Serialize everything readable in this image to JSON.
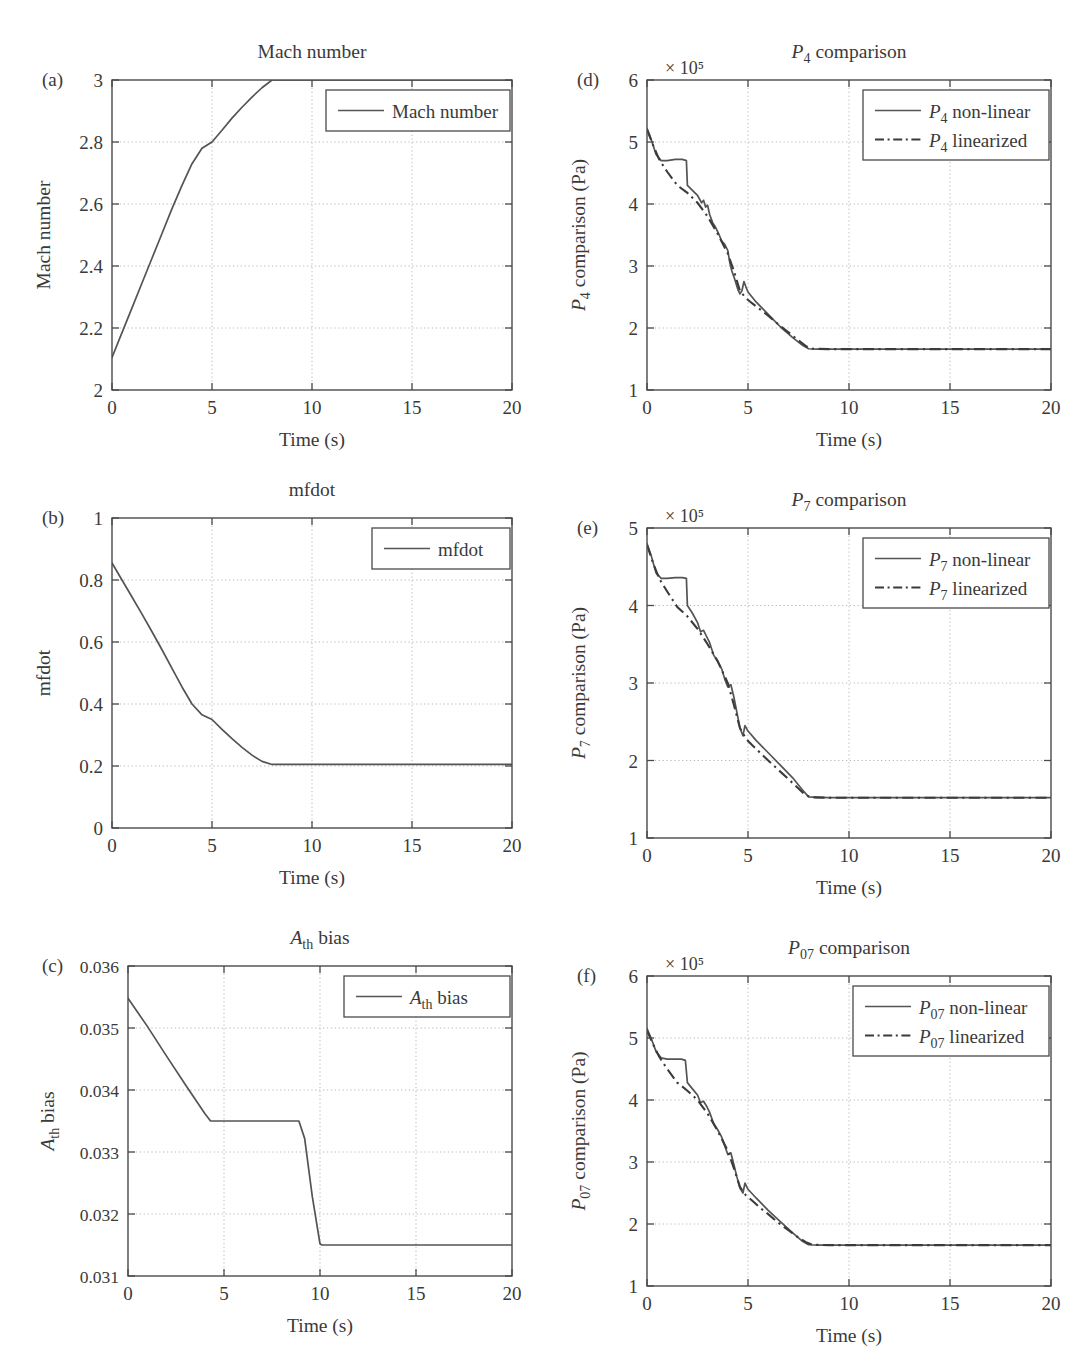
{
  "figure": {
    "panel_letters": [
      "(a)",
      "(b)",
      "(c)",
      "(d)",
      "(e)",
      "(f)"
    ],
    "xlabel": "Time (s)",
    "exponent_label": "× 10⁵"
  },
  "chart_data": [
    {
      "id": "a",
      "letter": "(a)",
      "type": "line",
      "title": "Mach number",
      "xlabel": "Time (s)",
      "ylabel": "Mach number",
      "xlim": [
        0,
        20
      ],
      "ylim": [
        2,
        3
      ],
      "xticks": [
        0,
        5,
        10,
        15,
        20
      ],
      "xticklabels": [
        "0",
        "5",
        "10",
        "15",
        "20"
      ],
      "yticks": [
        2,
        2.2,
        2.4,
        2.6,
        2.8,
        3
      ],
      "yticklabels": [
        "2",
        "2.2",
        "2.4",
        "2.6",
        "2.8",
        "3"
      ],
      "grid": true,
      "legend_position": "upper right",
      "series": [
        {
          "name": "Mach number",
          "style": "solid",
          "x": [
            0,
            0.5,
            1,
            1.5,
            2,
            2.5,
            3,
            3.5,
            4,
            4.5,
            5,
            5.5,
            6,
            6.5,
            7,
            7.5,
            8,
            8.5,
            20
          ],
          "y": [
            2.105,
            2.185,
            2.265,
            2.345,
            2.425,
            2.505,
            2.585,
            2.66,
            2.73,
            2.78,
            2.8,
            2.838,
            2.877,
            2.912,
            2.945,
            2.975,
            3.0,
            3.0,
            3.0
          ]
        }
      ]
    },
    {
      "id": "b",
      "letter": "(b)",
      "type": "line",
      "title": "mfdot",
      "xlabel": "Time (s)",
      "ylabel": "mfdot",
      "xlim": [
        0,
        20
      ],
      "ylim": [
        0,
        1
      ],
      "xticks": [
        0,
        5,
        10,
        15,
        20
      ],
      "xticklabels": [
        "0",
        "5",
        "10",
        "15",
        "20"
      ],
      "yticks": [
        0,
        0.2,
        0.4,
        0.6,
        0.8,
        1
      ],
      "yticklabels": [
        "0",
        "0.2",
        "0.4",
        "0.6",
        "0.8",
        "1"
      ],
      "grid": true,
      "legend_position": "upper right",
      "series": [
        {
          "name": "mfdot",
          "style": "solid",
          "x": [
            0,
            0.5,
            1,
            1.5,
            2,
            2.5,
            3,
            3.5,
            4,
            4.5,
            5,
            5.5,
            6,
            6.5,
            7,
            7.5,
            8,
            9,
            20
          ],
          "y": [
            0.855,
            0.8,
            0.745,
            0.69,
            0.633,
            0.575,
            0.515,
            0.455,
            0.4,
            0.365,
            0.35,
            0.318,
            0.288,
            0.26,
            0.235,
            0.215,
            0.205,
            0.205,
            0.205
          ]
        }
      ]
    },
    {
      "id": "c",
      "letter": "(c)",
      "type": "line",
      "title": "A_th bias",
      "title_parts": {
        "sym": "A",
        "sub": "th",
        "rest": " bias"
      },
      "xlabel": "Time (s)",
      "ylabel": "A_th bias",
      "xlim": [
        0,
        20
      ],
      "ylim": [
        0.031,
        0.036
      ],
      "xticks": [
        0,
        5,
        10,
        15,
        20
      ],
      "xticklabels": [
        "0",
        "5",
        "10",
        "15",
        "20"
      ],
      "yticks": [
        0.031,
        0.032,
        0.033,
        0.034,
        0.035,
        0.036
      ],
      "yticklabels": [
        "0.031",
        "0.032",
        "0.033",
        "0.034",
        "0.035",
        "0.036"
      ],
      "grid": true,
      "legend_position": "upper right",
      "series": [
        {
          "name": "A_th bias",
          "style": "solid",
          "x": [
            0,
            1,
            2,
            3,
            4,
            4.3,
            6,
            8,
            8.9,
            9.2,
            9.6,
            10,
            10.1,
            15,
            20
          ],
          "y": [
            0.03548,
            0.03503,
            0.03455,
            0.03408,
            0.03362,
            0.0335,
            0.0335,
            0.0335,
            0.0335,
            0.03322,
            0.03228,
            0.03152,
            0.0315,
            0.0315,
            0.0315
          ]
        }
      ]
    },
    {
      "id": "d",
      "letter": "(d)",
      "type": "line",
      "title": "P_4 comparison",
      "title_parts": {
        "sym": "P",
        "sub": "4",
        "rest": " comparison"
      },
      "xlabel": "Time (s)",
      "ylabel": "P_4 comparison (Pa)",
      "exponent_label": "× 10⁵",
      "xlim": [
        0,
        20
      ],
      "ylim": [
        1,
        6
      ],
      "xticks": [
        0,
        5,
        10,
        15,
        20
      ],
      "xticklabels": [
        "0",
        "5",
        "10",
        "15",
        "20"
      ],
      "yticks": [
        1,
        2,
        3,
        4,
        5,
        6
      ],
      "yticklabels": [
        "1",
        "2",
        "3",
        "4",
        "5",
        "6"
      ],
      "grid": true,
      "legend_position": "upper right",
      "legend_entries": [
        {
          "label_sym": "P",
          "label_sub": "4",
          "label_rest": " non-linear",
          "style": "solid"
        },
        {
          "label_sym": "P",
          "label_sub": "4",
          "label_rest": " linearized",
          "style": "dashdot"
        }
      ],
      "series": [
        {
          "name": "P_4 non-linear",
          "style": "solid",
          "x": [
            0,
            0.2,
            0.45,
            0.7,
            1.0,
            1.4,
            1.75,
            1.95,
            2.0,
            2.25,
            2.5,
            2.7,
            2.8,
            2.9,
            3.0,
            3.1,
            3.25,
            3.4,
            3.55,
            3.7,
            3.85,
            4.0,
            4.1,
            4.2,
            4.35,
            4.5,
            4.6,
            4.7,
            4.8,
            4.9,
            5.0,
            5.4,
            6.0,
            6.6,
            7.2,
            7.7,
            8.0,
            8.4,
            9.0,
            10,
            12,
            14,
            16,
            18,
            20
          ],
          "y": [
            5.22,
            5.05,
            4.8,
            4.7,
            4.7,
            4.72,
            4.72,
            4.7,
            4.3,
            4.22,
            4.14,
            4.02,
            4.06,
            3.95,
            3.98,
            3.83,
            3.7,
            3.62,
            3.52,
            3.4,
            3.35,
            3.25,
            3.05,
            2.92,
            2.78,
            2.62,
            2.55,
            2.6,
            2.75,
            2.66,
            2.58,
            2.42,
            2.22,
            2.02,
            1.85,
            1.72,
            1.665,
            1.66,
            1.66,
            1.66,
            1.66,
            1.66,
            1.66,
            1.66,
            1.66
          ]
        },
        {
          "name": "P_4 linearized",
          "style": "dashdot",
          "x": [
            0,
            0.3,
            0.6,
            1.0,
            1.5,
            2.0,
            2.5,
            3.0,
            3.5,
            4.0,
            4.3,
            4.6,
            4.9,
            5.2,
            5.6,
            6.0,
            6.5,
            7.0,
            7.5,
            7.9,
            8.2,
            9.0,
            10,
            12,
            14,
            16,
            18,
            20
          ],
          "y": [
            5.2,
            4.95,
            4.72,
            4.52,
            4.3,
            4.18,
            4.02,
            3.8,
            3.52,
            3.2,
            2.92,
            2.6,
            2.48,
            2.4,
            2.3,
            2.2,
            2.06,
            1.93,
            1.8,
            1.7,
            1.665,
            1.66,
            1.66,
            1.66,
            1.66,
            1.66,
            1.66,
            1.66
          ]
        }
      ]
    },
    {
      "id": "e",
      "letter": "(e)",
      "type": "line",
      "title": "P_7 comparison",
      "title_parts": {
        "sym": "P",
        "sub": "7",
        "rest": " comparison"
      },
      "xlabel": "Time (s)",
      "ylabel": "P_7 comparison (Pa)",
      "exponent_label": "× 10⁵",
      "xlim": [
        0,
        20
      ],
      "ylim": [
        1,
        5
      ],
      "xticks": [
        0,
        5,
        10,
        15,
        20
      ],
      "xticklabels": [
        "0",
        "5",
        "10",
        "15",
        "20"
      ],
      "yticks": [
        1,
        2,
        3,
        4,
        5
      ],
      "yticklabels": [
        "1",
        "2",
        "3",
        "4",
        "5"
      ],
      "grid": true,
      "legend_position": "upper right",
      "legend_entries": [
        {
          "label_sym": "P",
          "label_sub": "7",
          "label_rest": " non-linear",
          "style": "solid"
        },
        {
          "label_sym": "P",
          "label_sub": "7",
          "label_rest": " linearized",
          "style": "dashdot"
        }
      ],
      "series": [
        {
          "name": "P_7 non-linear",
          "style": "solid",
          "x": [
            0,
            0.2,
            0.45,
            0.7,
            1.0,
            1.4,
            1.75,
            1.95,
            2.0,
            2.25,
            2.5,
            2.65,
            2.8,
            2.95,
            3.1,
            3.3,
            3.5,
            3.7,
            3.85,
            4.0,
            4.15,
            4.3,
            4.45,
            4.6,
            4.75,
            4.85,
            5.0,
            5.4,
            6.0,
            6.6,
            7.2,
            7.7,
            8.0,
            8.5,
            9.0,
            10,
            12,
            14,
            16,
            18,
            20
          ],
          "y": [
            4.8,
            4.65,
            4.42,
            4.35,
            4.35,
            4.36,
            4.36,
            4.35,
            4.0,
            3.9,
            3.78,
            3.66,
            3.68,
            3.6,
            3.52,
            3.36,
            3.28,
            3.18,
            3.05,
            2.95,
            2.98,
            2.82,
            2.62,
            2.42,
            2.32,
            2.45,
            2.38,
            2.26,
            2.1,
            1.94,
            1.78,
            1.62,
            1.53,
            1.525,
            1.52,
            1.52,
            1.52,
            1.52,
            1.52,
            1.52,
            1.52
          ]
        },
        {
          "name": "P_7 linearized",
          "style": "dashdot",
          "x": [
            0,
            0.3,
            0.6,
            1.0,
            1.5,
            2.0,
            2.5,
            3.0,
            3.5,
            4.0,
            4.3,
            4.6,
            4.9,
            5.2,
            5.6,
            6.0,
            6.5,
            7.0,
            7.5,
            7.85,
            8.2,
            9.0,
            10,
            12,
            14,
            16,
            18,
            20
          ],
          "y": [
            4.78,
            4.55,
            4.35,
            4.18,
            3.98,
            3.86,
            3.7,
            3.5,
            3.28,
            3.0,
            2.72,
            2.42,
            2.28,
            2.2,
            2.1,
            2.0,
            1.88,
            1.76,
            1.64,
            1.55,
            1.525,
            1.52,
            1.52,
            1.52,
            1.52,
            1.52,
            1.52,
            1.52
          ]
        }
      ]
    },
    {
      "id": "f",
      "letter": "(f)",
      "type": "line",
      "title": "P_07 comparison",
      "title_parts": {
        "sym": "P",
        "sub": "07",
        "rest": " comparison"
      },
      "xlabel": "Time (s)",
      "ylabel": "P_07 comparison (Pa)",
      "exponent_label": "× 10⁵",
      "xlim": [
        0,
        20
      ],
      "ylim": [
        1,
        6
      ],
      "xticks": [
        0,
        5,
        10,
        15,
        20
      ],
      "xticklabels": [
        "0",
        "5",
        "10",
        "15",
        "20"
      ],
      "yticks": [
        1,
        2,
        3,
        4,
        5,
        6
      ],
      "yticklabels": [
        "1",
        "2",
        "3",
        "4",
        "5",
        "6"
      ],
      "grid": true,
      "legend_position": "upper right",
      "legend_entries": [
        {
          "label_sym": "P",
          "label_sub": "07",
          "label_rest": " non-linear",
          "style": "solid"
        },
        {
          "label_sym": "P",
          "label_sub": "07",
          "label_rest": " linearized",
          "style": "dashdot"
        }
      ],
      "series": [
        {
          "name": "P_07 non-linear",
          "style": "solid",
          "x": [
            0,
            0.2,
            0.45,
            0.7,
            1.0,
            1.4,
            1.7,
            1.9,
            2.0,
            2.25,
            2.5,
            2.65,
            2.8,
            2.95,
            3.1,
            3.3,
            3.5,
            3.7,
            3.85,
            4.0,
            4.15,
            4.3,
            4.45,
            4.6,
            4.75,
            4.85,
            5.0,
            5.4,
            6.0,
            6.6,
            7.2,
            7.7,
            8.0,
            8.5,
            9.0,
            10,
            12,
            14,
            16,
            18,
            20
          ],
          "y": [
            5.15,
            5.0,
            4.78,
            4.68,
            4.66,
            4.66,
            4.66,
            4.64,
            4.28,
            4.18,
            4.08,
            3.96,
            3.98,
            3.9,
            3.8,
            3.62,
            3.52,
            3.4,
            3.26,
            3.12,
            3.15,
            2.96,
            2.76,
            2.58,
            2.5,
            2.66,
            2.56,
            2.42,
            2.22,
            2.04,
            1.86,
            1.72,
            1.665,
            1.66,
            1.66,
            1.66,
            1.66,
            1.66,
            1.66,
            1.66,
            1.66
          ]
        },
        {
          "name": "P_07 linearized",
          "style": "dashdot",
          "x": [
            0,
            0.3,
            0.6,
            1.0,
            1.5,
            2.0,
            2.5,
            3.0,
            3.5,
            4.0,
            4.3,
            4.6,
            4.9,
            5.2,
            5.6,
            6.0,
            6.5,
            7.0,
            7.5,
            7.9,
            8.2,
            9.0,
            10,
            12,
            14,
            16,
            18,
            20
          ],
          "y": [
            5.12,
            4.9,
            4.7,
            4.5,
            4.28,
            4.15,
            4.0,
            3.78,
            3.5,
            3.18,
            2.9,
            2.6,
            2.46,
            2.38,
            2.26,
            2.16,
            2.02,
            1.9,
            1.78,
            1.7,
            1.665,
            1.66,
            1.66,
            1.66,
            1.66,
            1.66,
            1.66,
            1.66
          ]
        }
      ]
    }
  ]
}
